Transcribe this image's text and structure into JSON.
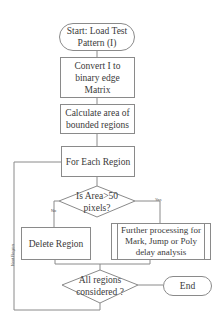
{
  "flowchart": {
    "nodes": {
      "start": {
        "label": "Start: Load Test Pattern (I)",
        "shape": "terminator"
      },
      "convert": {
        "label": "Convert I to binary edge Matrix",
        "shape": "process"
      },
      "calculate": {
        "label": "Calculate area of bounded regions",
        "shape": "process"
      },
      "for_each": {
        "label": "For Each Region",
        "shape": "process"
      },
      "area_check": {
        "label": "Is Area>50 pixels?",
        "shape": "decision"
      },
      "delete": {
        "label": "Delete Region",
        "shape": "process"
      },
      "further": {
        "label": "Further processing for Mark, Jump or Poly delay analysis",
        "shape": "predefined-process"
      },
      "all_considered": {
        "label": "All regions considered ?",
        "shape": "decision"
      },
      "end": {
        "label": "End",
        "shape": "terminator"
      }
    },
    "edge_labels": {
      "no": "No",
      "yes": "Yes",
      "next_region": "Next Region"
    },
    "colors": {
      "stroke": "#8a8a8a",
      "text": "#3a3a3a",
      "background": "#ffffff"
    }
  }
}
